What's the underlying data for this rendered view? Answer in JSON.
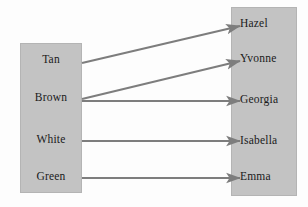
{
  "diagram": {
    "type": "bipartite-mapping",
    "background_color": "#fdfdfd",
    "box_fill_color": "#c3c3c3",
    "arrow_color": "#7d7d7d",
    "text_color": "#1a1a1a",
    "left_group": {
      "name": "colors",
      "items": [
        {
          "id": "tan",
          "label": "Tan",
          "y": 60
        },
        {
          "id": "brown",
          "label": "Brown",
          "y": 98
        },
        {
          "id": "white",
          "label": "White",
          "y": 140
        },
        {
          "id": "green",
          "label": "Green",
          "y": 177
        }
      ]
    },
    "right_group": {
      "name": "names",
      "items": [
        {
          "id": "hazel",
          "label": "Hazel",
          "y": 24
        },
        {
          "id": "yvonne",
          "label": "Yvonne",
          "y": 59
        },
        {
          "id": "georgia",
          "label": "Georgia",
          "y": 100
        },
        {
          "id": "isabella",
          "label": "Isabella",
          "y": 141
        },
        {
          "id": "emma",
          "label": "Emma",
          "y": 177
        }
      ]
    },
    "edges": [
      {
        "id": "tan-hazel",
        "from": "Tan",
        "to": "Hazel",
        "x1": 82,
        "y1": 63,
        "x2": 240,
        "y2": 26
      },
      {
        "id": "brown-yvonne",
        "from": "Brown",
        "to": "Yvonne",
        "x1": 82,
        "y1": 99,
        "x2": 240,
        "y2": 61
      },
      {
        "id": "brown-georgia",
        "from": "Brown",
        "to": "Georgia",
        "x1": 82,
        "y1": 101,
        "x2": 240,
        "y2": 101
      },
      {
        "id": "white-isabella",
        "from": "White",
        "to": "Isabella",
        "x1": 82,
        "y1": 141,
        "x2": 240,
        "y2": 141
      },
      {
        "id": "green-emma",
        "from": "Green",
        "to": "Emma",
        "x1": 82,
        "y1": 178,
        "x2": 240,
        "y2": 178
      }
    ]
  }
}
